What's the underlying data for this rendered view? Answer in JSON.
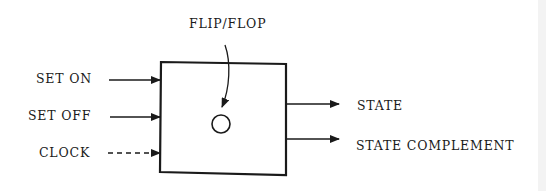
{
  "diagram": {
    "title_label": "FLIP/FLOP",
    "inputs": [
      {
        "label": "SET ON",
        "style": "solid"
      },
      {
        "label": "SET OFF",
        "style": "solid"
      },
      {
        "label": "CLOCK",
        "style": "dashed"
      }
    ],
    "outputs": [
      {
        "label": "STATE"
      },
      {
        "label": "STATE COMPLEMENT"
      }
    ],
    "colors": {
      "ink": "#1a1a1a",
      "background": "#ffffff"
    }
  }
}
